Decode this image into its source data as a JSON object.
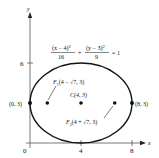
{
  "diagram": {
    "type": "ellipse-graph",
    "equation": {
      "term1_num": "(x − 4)",
      "term1_exp": "2",
      "term1_den": "16",
      "plus": "+",
      "term2_num": "(y − 3)",
      "term2_exp": "2",
      "term2_den": "9",
      "equals": "= 1"
    },
    "axes": {
      "x_label": "x",
      "y_label": "y",
      "origin_label": "0",
      "x_ticks": [
        "4",
        "8"
      ],
      "y_ticks": [
        "6"
      ]
    },
    "points": {
      "left_vertex": "(0, 3)",
      "right_vertex": "(8, 3)",
      "center": "C(4, 3)",
      "focus1_name": "F",
      "focus1_sub": "1",
      "focus1_coords": "(4 − √7, 3)",
      "focus2_name": "F",
      "focus2_sub": "2",
      "focus2_coords": "(4 + √7, 3)"
    },
    "ellipse": {
      "center": [
        4,
        3
      ],
      "a": 4,
      "b": 3,
      "c": "√7"
    },
    "colors": {
      "stroke": "#111111",
      "axis": "#555555",
      "background": "#ffffff"
    }
  }
}
